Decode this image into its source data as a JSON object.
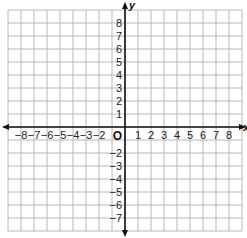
{
  "diagram": {
    "type": "coordinate-plane",
    "x_axis": {
      "label": "x",
      "range": [
        -9,
        9
      ],
      "tick_labels": [
        "−8",
        "−7",
        "−6",
        "−5",
        "−4",
        "−3",
        "−2",
        "1",
        "2",
        "3",
        "4",
        "5",
        "6",
        "7",
        "8"
      ],
      "tick_values": [
        -8,
        -7,
        -6,
        -5,
        -4,
        -3,
        -2,
        1,
        2,
        3,
        4,
        5,
        6,
        7,
        8
      ]
    },
    "y_axis": {
      "label": "y",
      "range": [
        -8,
        9
      ],
      "tick_labels": [
        "8",
        "7",
        "6",
        "5",
        "4",
        "3",
        "2",
        "1",
        "−2",
        "−3",
        "−4",
        "−5",
        "−6",
        "−7"
      ],
      "tick_values": [
        8,
        7,
        6,
        5,
        4,
        3,
        2,
        1,
        -2,
        -3,
        -4,
        -5,
        -6,
        -7
      ]
    },
    "origin_label": "O",
    "grid": {
      "on": true,
      "cell_px": 13,
      "left_px": 8,
      "top_px": 10,
      "columns": 18,
      "rows": 17,
      "line_color": "#b8b8b8",
      "axis_color": "#111111"
    }
  }
}
